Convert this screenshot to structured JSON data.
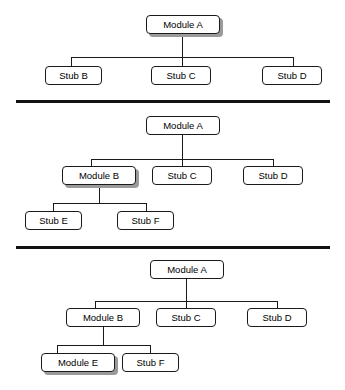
{
  "diagram": {
    "title": "Top-down integration testing stages",
    "background_color": "#ffffff",
    "line_color": "#1a1a1a",
    "divider_color": "#111111",
    "shadow_color": "#9a9a9a"
  },
  "stages": [
    {
      "name": "stage-1",
      "nodes": {
        "root": "Module A",
        "child_1": "Stub B",
        "child_2": "Stub C",
        "child_3": "Stub D"
      },
      "highlighted_node": "Module A"
    },
    {
      "name": "stage-2",
      "nodes": {
        "root": "Module A",
        "child_1": "Module B",
        "child_2": "Stub C",
        "child_3": "Stub D",
        "grandchild_1": "Stub E",
        "grandchild_2": "Stub F"
      },
      "highlighted_node": "Module B"
    },
    {
      "name": "stage-3",
      "nodes": {
        "root": "Module A",
        "child_1": "Module B",
        "child_2": "Stub C",
        "child_3": "Stub D",
        "grandchild_1": "Module E",
        "grandchild_2": "Stub F"
      },
      "highlighted_node": "Module E"
    }
  ]
}
